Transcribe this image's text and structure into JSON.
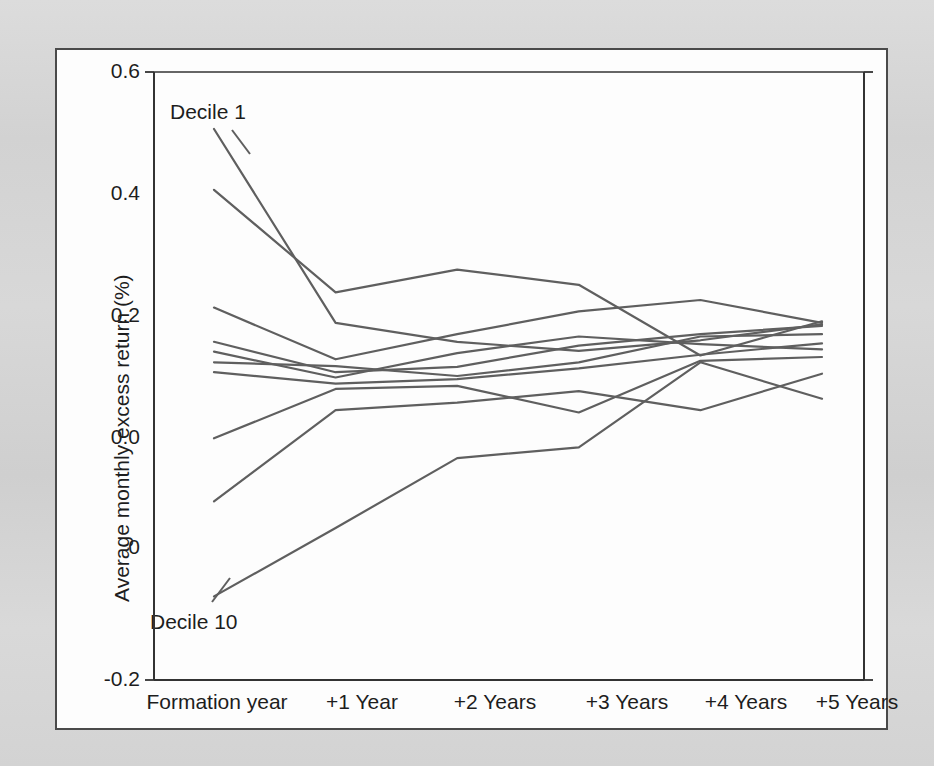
{
  "figure": {
    "background_color": "#d6d6d6",
    "panel_color": "#fdfdfd",
    "frame_color": "#4a4a4a",
    "line_color": "#5f5f5f"
  },
  "ghost_text": [
    {
      "text": "Fund Performance Classification",
      "x": 120,
      "y": 148,
      "size": 19,
      "weight": "bold"
    },
    {
      "text": "Number of Funds",
      "x": 470,
      "y": 148,
      "size": 19,
      "weight": "bold"
    },
    {
      "text": "Alpha (%)",
      "x": 760,
      "y": 148,
      "size": 19,
      "weight": "bold"
    },
    {
      "text": "significantly positive",
      "x": 120,
      "y": 212,
      "size": 17,
      "weight": "normal"
    },
    {
      "text": "of the funds in the sample are classified as truly skilled",
      "x": 120,
      "y": 372,
      "size": 17,
      "weight": "normal"
    },
    {
      "text": "unskilled managers and the remainder are considered to be",
      "x": 105,
      "y": 432,
      "size": 17,
      "weight": "normal"
    },
    {
      "text": "cross-section of mutual fund alphas",
      "x": 300,
      "y": 528,
      "size": 17,
      "weight": "normal"
    },
    {
      "text": "Evidence from ranking funds into deciles. Prior-year returns are used to rank funds into",
      "x": 80,
      "y": 578,
      "size": 17,
      "weight": "normal"
    },
    {
      "text": "deciles, and the post-formation performance is tracked over the subsequent five years.",
      "x": 80,
      "y": 602,
      "size": 17,
      "weight": "normal"
    },
    {
      "text": "The ordering of the deciles is largely preserved in the first year, but dissipates",
      "x": 80,
      "y": 626,
      "size": 17,
      "weight": "normal"
    },
    {
      "text": "thereafter, suggesting limited persistence in fund performance.",
      "x": 80,
      "y": 650,
      "size": 17,
      "weight": "normal"
    }
  ],
  "chart_data": {
    "type": "line",
    "title": "",
    "xlabel": "",
    "ylabel": "Average monthly excess return (%)",
    "categories": [
      "Formation year",
      "+1 Year",
      "+2 Years",
      "+3 Years",
      "+4 Years",
      "+5 Years"
    ],
    "x_tick_labels": [
      "Formation year",
      "+1 Year",
      "+2 Years",
      "+3 Years",
      "+4 Years",
      "+5 Years"
    ],
    "y_tick_labels": [
      "0.6",
      "0.4",
      "0.2",
      "0.0",
      "0",
      "-0.2"
    ],
    "y_tick_values": [
      0.6,
      0.4,
      0.2,
      0.0,
      -0.1,
      -0.2
    ],
    "ylim": [
      -0.2,
      0.6
    ],
    "grid": false,
    "legend": "none",
    "annotations": [
      {
        "text": "Decile 1",
        "x_px": 168,
        "y_px": 98
      },
      {
        "text": "Decile 10",
        "x_px": 148,
        "y_px": 608
      }
    ],
    "series": [
      {
        "name": "Decile 1",
        "values": [
          0.525,
          0.27,
          0.245,
          0.233,
          0.247,
          0.268
        ]
      },
      {
        "name": "Decile 2",
        "values": [
          0.445,
          0.31,
          0.34,
          0.32,
          0.227,
          0.272
        ]
      },
      {
        "name": "Decile 3",
        "values": [
          0.29,
          0.222,
          0.255,
          0.285,
          0.3,
          0.27
        ]
      },
      {
        "name": "Decile 4",
        "values": [
          0.245,
          0.205,
          0.212,
          0.24,
          0.255,
          0.266
        ]
      },
      {
        "name": "Decile 5",
        "values": [
          0.232,
          0.198,
          0.23,
          0.252,
          0.242,
          0.235
        ]
      },
      {
        "name": "Decile 6",
        "values": [
          0.218,
          0.213,
          0.2,
          0.218,
          0.252,
          0.255
        ]
      },
      {
        "name": "Decile 7",
        "values": [
          0.205,
          0.19,
          0.196,
          0.21,
          0.228,
          0.243
        ]
      },
      {
        "name": "Decile 8",
        "values": [
          0.118,
          0.183,
          0.187,
          0.152,
          0.22,
          0.225
        ]
      },
      {
        "name": "Decile 9",
        "values": [
          0.035,
          0.155,
          0.165,
          0.18,
          0.155,
          0.203
        ]
      },
      {
        "name": "Decile 10",
        "values": [
          -0.09,
          0.0,
          0.092,
          0.106,
          0.218,
          0.17
        ]
      }
    ]
  },
  "geometry": {
    "plot_left_px": 152,
    "plot_right_px": 862,
    "plot_top_px": 70,
    "plot_bottom_px": 678,
    "data_left_px": 212,
    "data_right_px": 820,
    "value_top": 0.6,
    "value_bottom": -0.2,
    "ytick_px": [
      70,
      192,
      314,
      436,
      546,
      678
    ]
  }
}
